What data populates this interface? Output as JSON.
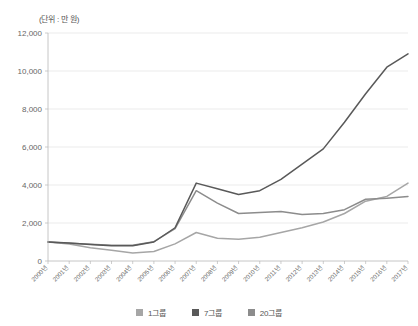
{
  "chart_data": {
    "type": "line",
    "title": "",
    "unit_note": "(단위 : 만 원)",
    "xlabel": "",
    "ylabel": "",
    "ylim": [
      0,
      12000
    ],
    "ytick_step": 2000,
    "ytick_labels": [
      "0",
      "2,000",
      "4,000",
      "6,000",
      "8,000",
      "10,000",
      "12,000"
    ],
    "ytick_values": [
      0,
      2000,
      4000,
      6000,
      8000,
      10000,
      12000
    ],
    "grid": true,
    "legend_position": "bottom",
    "categories": [
      "2000년",
      "2001년",
      "2002년",
      "2003년",
      "2004년",
      "2005년",
      "2006년",
      "2007년",
      "2008년",
      "2009년",
      "2010년",
      "2011년",
      "2012년",
      "2013년",
      "2014년",
      "2015년",
      "2016년",
      "2017년"
    ],
    "series": [
      {
        "name": "1그룹",
        "color": "#a6a6a6",
        "values": [
          1000,
          900,
          700,
          560,
          420,
          500,
          900,
          1500,
          1200,
          1150,
          1250,
          1500,
          1750,
          2050,
          2500,
          3150,
          3400,
          4100
        ]
      },
      {
        "name": "7그룹",
        "color": "#595959",
        "values": [
          1000,
          950,
          870,
          800,
          800,
          1000,
          1750,
          4100,
          3800,
          3500,
          3700,
          4300,
          5100,
          5900,
          7300,
          8800,
          10200,
          10900
        ]
      },
      {
        "name": "20그룹",
        "color": "#8c8c8c",
        "values": [
          1000,
          930,
          880,
          830,
          830,
          1020,
          1700,
          3700,
          3050,
          2500,
          2550,
          2600,
          2450,
          2500,
          2700,
          3250,
          3300,
          3400
        ]
      }
    ]
  },
  "legend": {
    "items": [
      {
        "label": "1그룹",
        "color": "#a6a6a6"
      },
      {
        "label": "7그룹",
        "color": "#595959"
      },
      {
        "label": "20그룹",
        "color": "#8c8c8c"
      }
    ]
  }
}
